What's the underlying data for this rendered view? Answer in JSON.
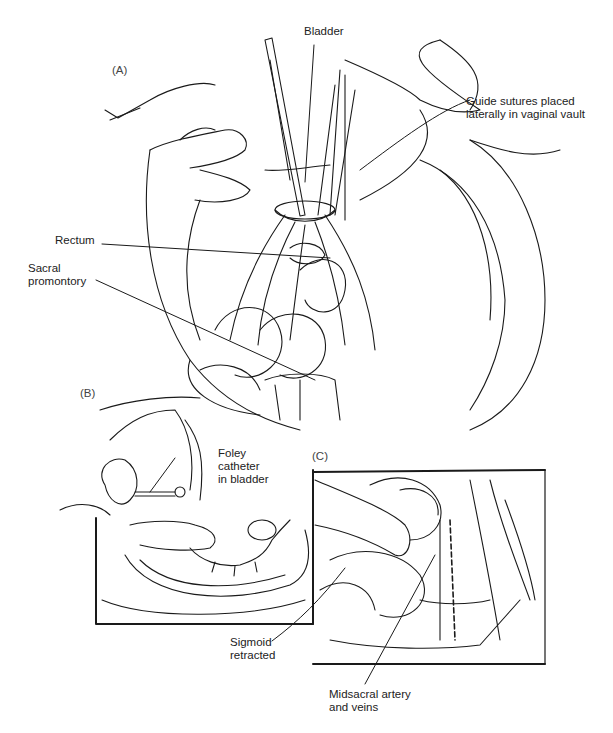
{
  "figure": {
    "panels": [
      {
        "id": "A",
        "tag": "(A)"
      },
      {
        "id": "B",
        "tag": "(B)"
      },
      {
        "id": "C",
        "tag": "(C)"
      }
    ],
    "labels": {
      "bladder": "Bladder",
      "guide_sutures": "Guide sutures placed\nlaterally in vaginal vault",
      "rectum": "Rectum",
      "sacral_promontory": "Sacral\npromontory",
      "foley_catheter": "Foley\ncatheter\nin bladder",
      "sigmoid_retracted": "Sigmoid\nretracted",
      "midsacral_vessels": "Midsacral artery\nand veins"
    },
    "colors": {
      "ink": "#1a1a1a",
      "background": "#ffffff"
    }
  }
}
